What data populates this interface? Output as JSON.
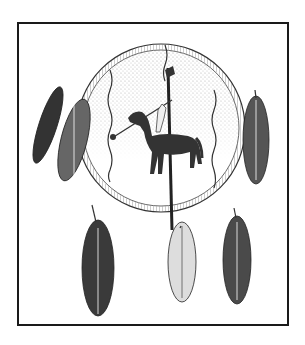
{
  "illustration": {
    "subject": "Shield with feathers and horse-and-rider painting",
    "colors": {
      "ink": "#1a1a1a",
      "paper": "#ffffff",
      "stipple": "#9a9a9a"
    },
    "elements": [
      "frame",
      "shield",
      "shield-rim",
      "horse",
      "rider",
      "lance",
      "staff",
      "wavy-lines",
      "feathers"
    ]
  }
}
